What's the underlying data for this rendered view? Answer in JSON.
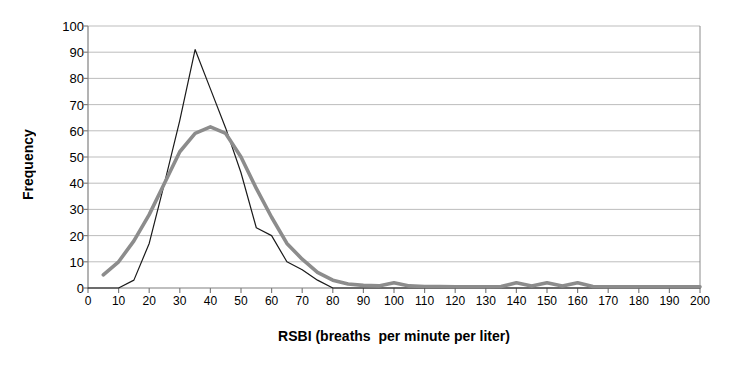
{
  "chart_data": {
    "type": "line",
    "title": "",
    "xlabel": "RSBI (breaths  per minute per liter)",
    "ylabel": "Frequency",
    "xlim": [
      0,
      200
    ],
    "ylim": [
      0,
      100
    ],
    "xticks": [
      0,
      10,
      20,
      30,
      40,
      50,
      60,
      70,
      80,
      90,
      100,
      110,
      120,
      130,
      140,
      150,
      160,
      170,
      180,
      190,
      200
    ],
    "yticks": [
      0,
      10,
      20,
      30,
      40,
      50,
      60,
      70,
      80,
      90,
      100
    ],
    "grid": "horizontal",
    "legend": "none",
    "x": [
      0,
      5,
      10,
      15,
      20,
      25,
      30,
      35,
      40,
      45,
      50,
      55,
      60,
      65,
      70,
      75,
      80,
      85,
      90,
      95,
      100,
      105,
      110,
      115,
      120,
      125,
      130,
      135,
      140,
      145,
      150,
      155,
      160,
      165,
      170,
      175,
      180,
      185,
      190,
      195,
      200
    ],
    "series": [
      {
        "name": "observed",
        "color": "#1a1a1a",
        "width": 1.2,
        "values": [
          0,
          0,
          0,
          3,
          17,
          40,
          64,
          91,
          76,
          61,
          44,
          23,
          20,
          10,
          7,
          3,
          0,
          0,
          0,
          0,
          0,
          0,
          0,
          0,
          0,
          0,
          0,
          0,
          0,
          0,
          0,
          0,
          0,
          0,
          0,
          0,
          0,
          0,
          0,
          0,
          0
        ]
      },
      {
        "name": "fitted",
        "color": "#8c8c8c",
        "width": 3.6,
        "values": [
          null,
          5,
          10,
          18,
          28,
          40,
          52,
          59,
          61.5,
          59,
          50,
          38,
          27,
          17,
          11,
          6,
          3,
          1.5,
          1,
          0.8,
          2,
          0.8,
          0.6,
          0.6,
          0.5,
          0.5,
          0.5,
          0.6,
          2,
          0.8,
          2,
          0.8,
          2,
          0.6,
          0.5,
          0.5,
          0.5,
          0.5,
          0.5,
          0.5,
          0.5
        ]
      }
    ]
  },
  "axes": {
    "y_title": "Frequency",
    "x_title": "RSBI (breaths  per minute per liter)"
  },
  "style": {
    "grid_color": "#b5b5b5",
    "axis_color": "#808080",
    "series_black": "#1a1a1a",
    "series_gray": "#8c8c8c",
    "background": "#ffffff"
  }
}
